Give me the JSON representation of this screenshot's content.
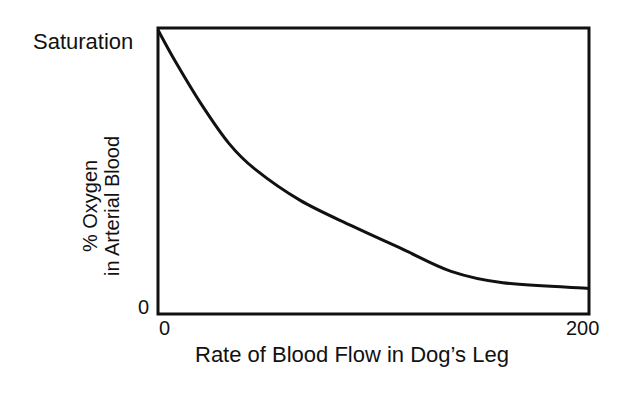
{
  "chart_data": {
    "type": "line",
    "title": "",
    "xlabel": "Rate of Blood Flow in Dog’s Leg",
    "ylabel": [
      "% Oxygen",
      "in Arterial Blood"
    ],
    "x_ticks": [
      "0",
      "200"
    ],
    "y_ticks": [
      "0",
      "Saturation"
    ],
    "xlim": [
      0,
      200
    ],
    "ylim": [
      0,
      100
    ],
    "grid": false,
    "legend": null,
    "series": [
      {
        "name": "% Oxygen in Arterial Blood",
        "x": [
          0,
          8,
          20,
          33,
          45,
          66,
          90,
          113,
          136,
          160,
          200
        ],
        "y": [
          100,
          89,
          74,
          60,
          51,
          40,
          31,
          23,
          15,
          11,
          9
        ]
      }
    ]
  },
  "labels": {
    "y_top": "Saturation",
    "y_zero": "0",
    "x_zero": "0",
    "x_max": "200",
    "xlabel": "Rate of Blood Flow in Dog’s Leg",
    "ylabel_line1": "% Oxygen",
    "ylabel_line2": "in Arterial Blood"
  },
  "colors": {
    "line": "#111111",
    "axes": "#111111",
    "background": "#ffffff"
  }
}
